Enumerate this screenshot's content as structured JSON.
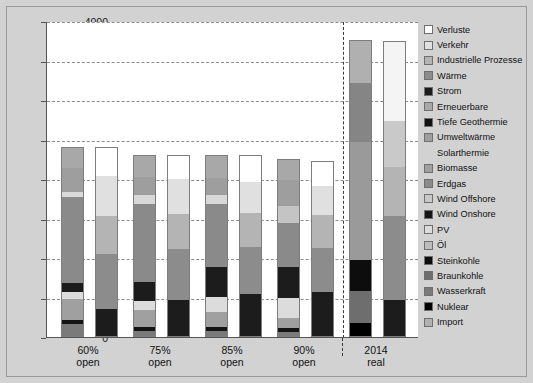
{
  "chart_data": {
    "type": "bar",
    "title": "",
    "subtitle": "",
    "unit_label": "TWh/Jahr",
    "xlabel": "",
    "ylabel": "TWh/Jahr",
    "ylim": [
      0,
      4000
    ],
    "yticks": [
      0,
      500,
      1000,
      1500,
      2000,
      2500,
      3000,
      3500,
      4000
    ],
    "ytick_labels": [
      "0",
      "500",
      "1000",
      "1500",
      "2000",
      "2500",
      "3000",
      "3500",
      "4000"
    ],
    "grid": true,
    "legend_position": "right",
    "stacked": true,
    "categories": [
      "60% open",
      "75% open",
      "85% open",
      "90% open",
      "2014 real"
    ],
    "category_labels": [
      {
        "line1": "60%",
        "line2": "open"
      },
      {
        "line1": "75%",
        "line2": "open"
      },
      {
        "line1": "85%",
        "line2": "open"
      },
      {
        "line1": "90%",
        "line2": "open"
      },
      {
        "line1": "2014",
        "line2": "real"
      }
    ],
    "legend": [
      {
        "label": "Verluste",
        "color": "#ffffff"
      },
      {
        "label": "Verkehr",
        "color": "#e0e0e0"
      },
      {
        "label": "Industrielle Prozesse",
        "color": "#b4b4b4"
      },
      {
        "label": "Wärme",
        "color": "#8c8c8c"
      },
      {
        "label": "Strom",
        "color": "#1c1c1c"
      },
      {
        "label": "Erneuerbare",
        "color": "#a8a8a8"
      },
      {
        "label": "Tiefe Geothermie",
        "color": "#111111"
      },
      {
        "label": "Umweltwärme",
        "color": "#9e9e9e"
      },
      {
        "label": "Solarthermie",
        "color": "#d2d2d2"
      },
      {
        "label": "Biomasse",
        "color": "#a0a0a0"
      },
      {
        "label": "Erdgas",
        "color": "#8a8a8a"
      },
      {
        "label": "Wind Offshore",
        "color": "#c8c8c8"
      },
      {
        "label": "Wind Onshore",
        "color": "#141414"
      },
      {
        "label": "PV",
        "color": "#dcdcdc"
      },
      {
        "label": "Öl",
        "color": "#bdbdbd"
      },
      {
        "label": "Steinkohle",
        "color": "#0d0d0d"
      },
      {
        "label": "Braunkohle",
        "color": "#6e6e6e"
      },
      {
        "label": "Wasserkraft",
        "color": "#7a7a7a"
      },
      {
        "label": "Nuklear",
        "color": "#000000"
      },
      {
        "label": "Import",
        "color": "#b0b0b0"
      }
    ],
    "bars": [
      {
        "group": "60% open",
        "side": "supply",
        "total": 2410,
        "segments": [
          {
            "name": "Wasserkraft",
            "value": 160,
            "color": "#7a7a7a"
          },
          {
            "name": "Wind Onshore",
            "value": 55,
            "color": "#141414"
          },
          {
            "name": "Biomasse",
            "value": 270,
            "color": "#a0a0a0"
          },
          {
            "name": "PV",
            "value": 80,
            "color": "#dcdcdc"
          },
          {
            "name": "Steinkohle",
            "value": 115,
            "color": "#1c1c1c"
          },
          {
            "name": "Erdgas",
            "value": 1090,
            "color": "#8a8a8a"
          },
          {
            "name": "Solarthermie",
            "value": 70,
            "color": "#dadada"
          },
          {
            "name": "Umweltwärme",
            "value": 300,
            "color": "#9e9e9e"
          },
          {
            "name": "Erneuerbare",
            "value": 270,
            "color": "#a8a8a8"
          }
        ]
      },
      {
        "group": "60% open",
        "side": "demand",
        "total": 2400,
        "segments": [
          {
            "name": "Strom",
            "value": 360,
            "color": "#1c1c1c"
          },
          {
            "name": "Wärme",
            "value": 690,
            "color": "#8c8c8c"
          },
          {
            "name": "Industrielle Prozesse",
            "value": 480,
            "color": "#b4b4b4"
          },
          {
            "name": "Verkehr",
            "value": 510,
            "color": "#e0e0e0"
          },
          {
            "name": "Verluste",
            "value": 360,
            "color": "#ffffff"
          }
        ]
      },
      {
        "group": "75% open",
        "side": "supply",
        "total": 2300,
        "segments": [
          {
            "name": "Wasserkraft",
            "value": 75,
            "color": "#7a7a7a"
          },
          {
            "name": "Wind Onshore",
            "value": 55,
            "color": "#141414"
          },
          {
            "name": "Biomasse",
            "value": 210,
            "color": "#a0a0a0"
          },
          {
            "name": "PV",
            "value": 110,
            "color": "#dcdcdc"
          },
          {
            "name": "Steinkohle",
            "value": 250,
            "color": "#1c1c1c"
          },
          {
            "name": "Erdgas",
            "value": 980,
            "color": "#8a8a8a"
          },
          {
            "name": "Solarthermie",
            "value": 120,
            "color": "#d8d8d8"
          },
          {
            "name": "Umweltwärme",
            "value": 230,
            "color": "#9e9e9e"
          },
          {
            "name": "Erneuerbare",
            "value": 270,
            "color": "#a8a8a8"
          }
        ]
      },
      {
        "group": "75% open",
        "side": "demand",
        "total": 2300,
        "segments": [
          {
            "name": "Strom",
            "value": 470,
            "color": "#1c1c1c"
          },
          {
            "name": "Wärme",
            "value": 650,
            "color": "#8c8c8c"
          },
          {
            "name": "Industrielle Prozesse",
            "value": 440,
            "color": "#b4b4b4"
          },
          {
            "name": "Verkehr",
            "value": 440,
            "color": "#e0e0e0"
          },
          {
            "name": "Verluste",
            "value": 300,
            "color": "#ffffff"
          }
        ]
      },
      {
        "group": "85% open",
        "side": "supply",
        "total": 2300,
        "segments": [
          {
            "name": "Wasserkraft",
            "value": 70,
            "color": "#7a7a7a"
          },
          {
            "name": "Wind Onshore",
            "value": 60,
            "color": "#141414"
          },
          {
            "name": "Biomasse",
            "value": 190,
            "color": "#a0a0a0"
          },
          {
            "name": "PV",
            "value": 190,
            "color": "#dcdcdc"
          },
          {
            "name": "Steinkohle",
            "value": 380,
            "color": "#1c1c1c"
          },
          {
            "name": "Erdgas",
            "value": 790,
            "color": "#8a8a8a"
          },
          {
            "name": "Solarthermie",
            "value": 120,
            "color": "#d8d8d8"
          },
          {
            "name": "Umweltwärme",
            "value": 210,
            "color": "#9e9e9e"
          },
          {
            "name": "Erneuerbare",
            "value": 290,
            "color": "#a8a8a8"
          }
        ]
      },
      {
        "group": "85% open",
        "side": "demand",
        "total": 2300,
        "segments": [
          {
            "name": "Strom",
            "value": 540,
            "color": "#1c1c1c"
          },
          {
            "name": "Wärme",
            "value": 600,
            "color": "#8c8c8c"
          },
          {
            "name": "Industrielle Prozesse",
            "value": 430,
            "color": "#b4b4b4"
          },
          {
            "name": "Verkehr",
            "value": 390,
            "color": "#e0e0e0"
          },
          {
            "name": "Verluste",
            "value": 340,
            "color": "#ffffff"
          }
        ]
      },
      {
        "group": "90% open",
        "side": "supply",
        "total": 2250,
        "segments": [
          {
            "name": "Wasserkraft",
            "value": 60,
            "color": "#7a7a7a"
          },
          {
            "name": "Wind Onshore",
            "value": 55,
            "color": "#141414"
          },
          {
            "name": "Biomasse",
            "value": 130,
            "color": "#a0a0a0"
          },
          {
            "name": "PV",
            "value": 250,
            "color": "#dcdcdc"
          },
          {
            "name": "Steinkohle",
            "value": 390,
            "color": "#1c1c1c"
          },
          {
            "name": "Erdgas",
            "value": 560,
            "color": "#8a8a8a"
          },
          {
            "name": "Solarthermie",
            "value": 220,
            "color": "#c4c4c4"
          },
          {
            "name": "Umweltwärme",
            "value": 320,
            "color": "#9e9e9e"
          },
          {
            "name": "Erneuerbare",
            "value": 265,
            "color": "#a8a8a8"
          }
        ]
      },
      {
        "group": "90% open",
        "side": "demand",
        "total": 2230,
        "segments": [
          {
            "name": "Strom",
            "value": 570,
            "color": "#1c1c1c"
          },
          {
            "name": "Wärme",
            "value": 560,
            "color": "#8c8c8c"
          },
          {
            "name": "Industrielle Prozesse",
            "value": 420,
            "color": "#b4b4b4"
          },
          {
            "name": "Verkehr",
            "value": 360,
            "color": "#e0e0e0"
          },
          {
            "name": "Verluste",
            "value": 320,
            "color": "#ffffff"
          }
        ]
      },
      {
        "group": "2014 real",
        "side": "supply",
        "total": 3760,
        "segments": [
          {
            "name": "Nuklear",
            "value": 180,
            "color": "#000000"
          },
          {
            "name": "Braunkohle",
            "value": 400,
            "color": "#6e6e6e"
          },
          {
            "name": "Steinkohle",
            "value": 390,
            "color": "#0d0d0d"
          },
          {
            "name": "Öl",
            "value": 1500,
            "color": "#9a9a9a"
          },
          {
            "name": "Erdgas",
            "value": 750,
            "color": "#858585"
          },
          {
            "name": "Import",
            "value": 540,
            "color": "#b0b0b0"
          }
        ]
      },
      {
        "group": "2014 real",
        "side": "demand",
        "total": 3750,
        "segments": [
          {
            "name": "Strom",
            "value": 470,
            "color": "#1c1c1c"
          },
          {
            "name": "Wärme",
            "value": 1060,
            "color": "#8c8c8c"
          },
          {
            "name": "Industrielle Prozesse",
            "value": 620,
            "color": "#b4b4b4"
          },
          {
            "name": "Verkehr",
            "value": 580,
            "color": "#c9c9c9"
          },
          {
            "name": "Verluste",
            "value": 1020,
            "color": "#f4f4f4"
          }
        ]
      }
    ]
  },
  "colors": {
    "page_background": "#d2d2d2",
    "plot_background": "#ffffff",
    "axis": "#555555",
    "grid": "#8d8d8d",
    "text": "#111111"
  }
}
